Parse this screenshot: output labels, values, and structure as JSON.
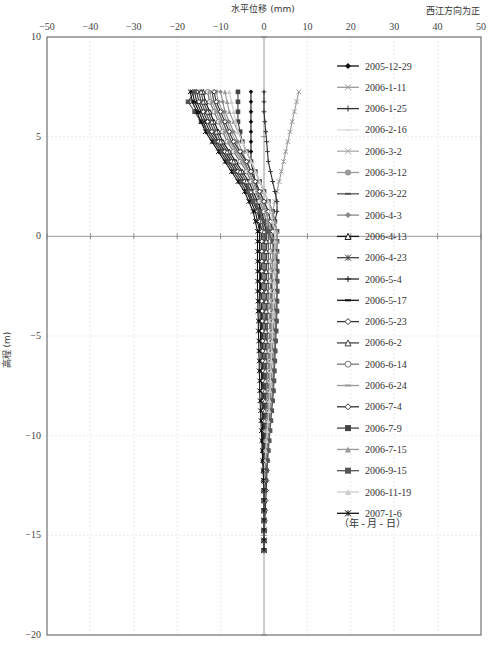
{
  "chart_data": {
    "type": "line",
    "title": "水平位移 (mm)",
    "direction_note": "西江方向为正",
    "xlabel": "水平位移 (mm)",
    "ylabel": "高程 (m)",
    "xlim": [
      -50,
      50
    ],
    "ylim": [
      -20,
      10
    ],
    "x_ticks": [
      -50,
      -40,
      -30,
      -20,
      -10,
      0,
      10,
      20,
      30,
      40,
      50
    ],
    "y_ticks": [
      10,
      5,
      0,
      -5,
      -10,
      -15,
      -20
    ],
    "grid": true,
    "legend_position": "right-inside",
    "legend_footer": "（年 - 月 - 日）",
    "depth": [
      7.25,
      6.75,
      6.25,
      5.75,
      5.25,
      4.75,
      4.25,
      3.75,
      3.25,
      2.75,
      2.25,
      1.75,
      1.25,
      0.75,
      0.25,
      -0.25,
      -0.75,
      -1.25,
      -1.75,
      -2.25,
      -2.75,
      -3.25,
      -3.75,
      -4.25,
      -4.75,
      -5.25,
      -5.75,
      -6.25,
      -6.75,
      -7.25,
      -7.75,
      -8.25,
      -8.75,
      -9.25,
      -9.75,
      -10.25,
      -10.75,
      -11.25,
      -11.75,
      -12.25,
      -12.75,
      -13.25,
      -13.75,
      -14.25,
      -14.75,
      -15.25,
      -15.75
    ],
    "series": [
      {
        "name": "2005-12-29",
        "color": "#111111",
        "marker": "diamond",
        "values": [
          -3,
          -3,
          -3,
          -3,
          -3,
          -3,
          -3,
          -3,
          -2.5,
          -2,
          -1.5,
          -1,
          -1,
          -1,
          -1,
          -1,
          -1,
          -1,
          -0.8,
          -0.8,
          -0.8,
          -0.6,
          -0.6,
          -0.6,
          -0.5,
          -0.5,
          -0.4,
          -0.4,
          -0.3,
          -0.3,
          -0.2,
          -0.2,
          -0.2,
          -0.1,
          -0.1,
          0,
          0,
          0,
          0,
          0,
          0,
          0,
          0,
          0,
          0,
          0,
          0
        ]
      },
      {
        "name": "2006-1-11",
        "color": "#999999",
        "marker": "x",
        "values": [
          8,
          7.5,
          7,
          6.5,
          6,
          5.5,
          5,
          4.5,
          4,
          3.5,
          3,
          2.5,
          2,
          2,
          2,
          2,
          2,
          2,
          2,
          1.8,
          1.8,
          1.6,
          1.6,
          1.5,
          1.4,
          1.3,
          1.2,
          1.1,
          1,
          1,
          0.9,
          0.8,
          0.7,
          0.6,
          0.5,
          0.4,
          0.3,
          0.3,
          0.2,
          0.2,
          0.1,
          0.1,
          0,
          0,
          0,
          0,
          0
        ]
      },
      {
        "name": "2006-1-25",
        "color": "#333333",
        "marker": "plus",
        "values": [
          0,
          0,
          0,
          0.2,
          0.4,
          0.6,
          0.8,
          1,
          1.5,
          2,
          2.5,
          3,
          3,
          2.5,
          2,
          2,
          2,
          2,
          1.8,
          1.8,
          1.7,
          1.6,
          1.5,
          1.4,
          1.3,
          1.2,
          1.1,
          1,
          1,
          0.9,
          0.8,
          0.7,
          0.6,
          0.5,
          0.4,
          0.3,
          0.3,
          0.2,
          0.2,
          0.1,
          0.1,
          0,
          0,
          0,
          0,
          0,
          0
        ]
      },
      {
        "name": "2006-2-16",
        "color": "#dddddd",
        "marker": "dash",
        "values": [
          -13,
          -12.5,
          -11.5,
          -10.5,
          -9.5,
          -8.5,
          -7,
          -5.5,
          -4,
          -3,
          -2,
          -1,
          0,
          0.5,
          0.5,
          0.5,
          0.5,
          0.5,
          0.5,
          0.5,
          0.5,
          0.5,
          0.5,
          0.4,
          0.4,
          0.4,
          0.3,
          0.3,
          0.3,
          0.2,
          0.2,
          0.2,
          0.2,
          0.1,
          0.1,
          0.1,
          0,
          0,
          0,
          0,
          0,
          0,
          0,
          0,
          0,
          0,
          0
        ]
      },
      {
        "name": "2006-3-2",
        "color": "#aaaaaa",
        "marker": "x",
        "values": [
          -12,
          -11.5,
          -10.5,
          -9.5,
          -8.5,
          -7.5,
          -6.5,
          -5,
          -3.5,
          -2.5,
          -1.5,
          -0.5,
          0.5,
          1,
          1,
          1,
          1,
          1,
          1,
          1,
          0.9,
          0.9,
          0.8,
          0.8,
          0.7,
          0.7,
          0.6,
          0.6,
          0.5,
          0.5,
          0.4,
          0.4,
          0.3,
          0.3,
          0.2,
          0.2,
          0.1,
          0.1,
          0,
          0,
          0,
          0,
          0,
          0,
          0,
          0,
          0
        ]
      },
      {
        "name": "2006-3-12",
        "color": "#999999",
        "marker": "circle",
        "values": [
          -11,
          -10.5,
          -9.5,
          -8.5,
          -7.5,
          -6.5,
          -5.5,
          -4,
          -3,
          -2,
          -1,
          0,
          1,
          1.5,
          1.5,
          1.5,
          1.5,
          1.5,
          1.5,
          1.5,
          1.4,
          1.4,
          1.3,
          1.3,
          1.2,
          1.2,
          1.1,
          1.1,
          1,
          1,
          0.9,
          0.8,
          0.8,
          0.7,
          0.6,
          0.5,
          0.4,
          0.3,
          0.2,
          0.1,
          0,
          0,
          0,
          0,
          0,
          0,
          0
        ]
      },
      {
        "name": "2006-3-22",
        "color": "#555555",
        "marker": "dash",
        "values": [
          -12,
          -11.5,
          -10.5,
          -9.5,
          -8.5,
          -7.5,
          -6,
          -4.5,
          -3.5,
          -2.5,
          -1.5,
          -0.5,
          0.5,
          1,
          1,
          1,
          1,
          1,
          1,
          1,
          1,
          0.9,
          0.9,
          0.8,
          0.8,
          0.7,
          0.7,
          0.6,
          0.6,
          0.5,
          0.5,
          0.4,
          0.4,
          0.3,
          0.3,
          0.2,
          0.2,
          0.1,
          0.1,
          0,
          0,
          0,
          0,
          0,
          0,
          0,
          0
        ]
      },
      {
        "name": "2006-4-3",
        "color": "#888888",
        "marker": "diamond",
        "values": [
          -10,
          -9.5,
          -9,
          -8,
          -7,
          -6,
          -5,
          -4,
          -3,
          -2,
          -1,
          0,
          1,
          1.5,
          2,
          2,
          2,
          2,
          2,
          1.9,
          1.9,
          1.8,
          1.8,
          1.7,
          1.6,
          1.5,
          1.4,
          1.3,
          1.2,
          1.1,
          1,
          0.9,
          0.8,
          0.7,
          0.6,
          0.5,
          0.4,
          0.3,
          0.2,
          0.1,
          0,
          0,
          0,
          0,
          0,
          0,
          0
        ]
      },
      {
        "name": "2006-4-13",
        "color": "#111111",
        "marker": "triangle-open",
        "values": [
          -14,
          -13.5,
          -12.5,
          -11.5,
          -10.5,
          -9.5,
          -8,
          -6.5,
          -5,
          -3.5,
          -2.5,
          -1.5,
          -0.5,
          0,
          0.5,
          0.5,
          0.5,
          0.5,
          0.5,
          0.5,
          0.5,
          0.5,
          0.5,
          0.4,
          0.4,
          0.4,
          0.3,
          0.3,
          0.3,
          0.2,
          0.2,
          0.2,
          0.1,
          0.1,
          0,
          0,
          0,
          0,
          0,
          0,
          0,
          0,
          0,
          0,
          0,
          0,
          0
        ]
      },
      {
        "name": "2006-4-23",
        "color": "#444444",
        "marker": "asterisk",
        "values": [
          -15,
          -14.5,
          -13.5,
          -12.5,
          -11.5,
          -10.5,
          -9,
          -7.5,
          -6,
          -4.5,
          -3,
          -2,
          -1,
          -0.5,
          0,
          0,
          0,
          0,
          0,
          0,
          0,
          0,
          0,
          0,
          0,
          0,
          0,
          0,
          0,
          0,
          0,
          0,
          0,
          0,
          0,
          0,
          0,
          0,
          0,
          0,
          0,
          0,
          0,
          0,
          0,
          0,
          0
        ]
      },
      {
        "name": "2006-5-4",
        "color": "#222222",
        "marker": "plus",
        "values": [
          -16,
          -15.5,
          -14.5,
          -13.5,
          -12.5,
          -11,
          -9.5,
          -8,
          -6.5,
          -5,
          -3.5,
          -2.5,
          -1.5,
          -1,
          -0.5,
          -0.5,
          -0.5,
          -0.5,
          -0.5,
          -0.5,
          -0.5,
          -0.5,
          -0.5,
          -0.5,
          -0.4,
          -0.4,
          -0.4,
          -0.3,
          -0.3,
          -0.3,
          -0.2,
          -0.2,
          -0.2,
          -0.1,
          -0.1,
          -0.1,
          0,
          0,
          0,
          0,
          0,
          0,
          0,
          0,
          0,
          0,
          0
        ]
      },
      {
        "name": "2006-5-17",
        "color": "#111111",
        "marker": "dash",
        "values": [
          -16.5,
          -16,
          -15,
          -14,
          -13,
          -11.5,
          -10,
          -8.5,
          -7,
          -5.5,
          -4,
          -3,
          -2,
          -1.5,
          -1,
          -1,
          -1,
          -1,
          -1,
          -1,
          -1,
          -1,
          -0.9,
          -0.9,
          -0.8,
          -0.8,
          -0.7,
          -0.7,
          -0.6,
          -0.6,
          -0.5,
          -0.5,
          -0.4,
          -0.4,
          -0.3,
          -0.3,
          -0.2,
          -0.2,
          -0.1,
          -0.1,
          0,
          0,
          0,
          0,
          0,
          0,
          0
        ]
      },
      {
        "name": "2006-5-23",
        "color": "#333333",
        "marker": "diamond-open",
        "values": [
          -15.5,
          -15,
          -14,
          -13,
          -12,
          -10.5,
          -9,
          -7.5,
          -6,
          -4.5,
          -3.5,
          -2.5,
          -1.5,
          -1,
          -0.5,
          -0.5,
          -0.5,
          -0.5,
          -0.5,
          -0.5,
          -0.5,
          -0.5,
          -0.4,
          -0.4,
          -0.4,
          -0.3,
          -0.3,
          -0.3,
          -0.2,
          -0.2,
          -0.2,
          -0.1,
          -0.1,
          -0.1,
          0,
          0,
          0,
          0,
          0,
          0,
          0,
          0,
          0,
          0,
          0,
          0,
          0
        ]
      },
      {
        "name": "2006-6-2",
        "color": "#444444",
        "marker": "triangle-open",
        "values": [
          -14.5,
          -14,
          -13,
          -12,
          -11,
          -10,
          -8.5,
          -7,
          -5.5,
          -4,
          -3,
          -2,
          -1,
          -0.5,
          0,
          0.5,
          0.5,
          0.5,
          0.5,
          0.5,
          0.5,
          0.5,
          0.5,
          0.5,
          0.4,
          0.4,
          0.4,
          0.3,
          0.3,
          0.3,
          0.2,
          0.2,
          0.2,
          0.1,
          0.1,
          0.1,
          0,
          0,
          0,
          0,
          0,
          0,
          0,
          0,
          0,
          0,
          0
        ]
      },
      {
        "name": "2006-6-14",
        "color": "#777777",
        "marker": "circle-open",
        "values": [
          -13,
          -12.5,
          -11.5,
          -10.5,
          -9.5,
          -8.5,
          -7,
          -5.5,
          -4,
          -3,
          -2,
          -1,
          0,
          0.5,
          1,
          1.5,
          1.5,
          1.5,
          1.5,
          1.5,
          1.5,
          1.5,
          1.4,
          1.4,
          1.3,
          1.3,
          1.2,
          1.2,
          1.1,
          1.1,
          1,
          1,
          0.9,
          0.8,
          0.7,
          0.6,
          0.5,
          0.4,
          0.3,
          0.2,
          0.1,
          0,
          0,
          0,
          0,
          0,
          0
        ]
      },
      {
        "name": "2006-6-24",
        "color": "#999999",
        "marker": "dash",
        "values": [
          -12.5,
          -12,
          -11,
          -10,
          -9,
          -8,
          -6.5,
          -5,
          -3.5,
          -2.5,
          -1.5,
          -0.5,
          0.5,
          1,
          1.5,
          2,
          2,
          2,
          2,
          2,
          2,
          1.9,
          1.9,
          1.8,
          1.8,
          1.7,
          1.6,
          1.5,
          1.4,
          1.3,
          1.2,
          1.1,
          1,
          0.9,
          0.8,
          0.7,
          0.6,
          0.5,
          0.4,
          0.3,
          0.2,
          0.1,
          0,
          0,
          0,
          0,
          0
        ]
      },
      {
        "name": "2006-7-4",
        "color": "#333333",
        "marker": "diamond-open",
        "values": [
          -11.5,
          -11,
          -10,
          -9,
          -8,
          -7,
          -5.5,
          -4,
          -3,
          -2,
          -1,
          0,
          1,
          1.5,
          2,
          2.5,
          2.5,
          2.5,
          2.5,
          2.5,
          2.4,
          2.4,
          2.3,
          2.2,
          2.1,
          2,
          1.9,
          1.8,
          1.7,
          1.6,
          1.5,
          1.4,
          1.3,
          1.2,
          1.1,
          1,
          0.9,
          0.8,
          0.7,
          0.6,
          0.5,
          0.4,
          0.3,
          0.2,
          0.1,
          0,
          0
        ]
      },
      {
        "name": "2006-7-9",
        "color": "#444444",
        "marker": "square",
        "values": [
          -6,
          -6,
          -6,
          -6,
          -5.5,
          -5,
          -4,
          -3,
          -2,
          -1,
          0,
          1,
          2,
          2.5,
          3,
          3,
          3,
          3,
          3,
          3,
          3,
          2.9,
          2.8,
          2.7,
          2.6,
          2.5,
          2.4,
          2.3,
          2.2,
          2.1,
          2,
          1.8,
          1.6,
          1.4,
          1.2,
          1,
          0.8,
          0.6,
          0.4,
          0.2,
          0,
          0,
          0,
          0,
          0,
          0,
          0
        ]
      },
      {
        "name": "2006-7-15",
        "color": "#999999",
        "marker": "triangle",
        "values": [
          -9,
          -8.5,
          -8,
          -7,
          -6,
          -5,
          -4,
          -3,
          -2,
          -1,
          0,
          1,
          2,
          2.5,
          3,
          3,
          3,
          3,
          3,
          2.9,
          2.9,
          2.8,
          2.7,
          2.6,
          2.5,
          2.4,
          2.3,
          2.2,
          2.1,
          2,
          1.9,
          1.8,
          1.6,
          1.4,
          1.2,
          1,
          0.8,
          0.6,
          0.4,
          0.2,
          0,
          0,
          0,
          0,
          0,
          0,
          0
        ]
      },
      {
        "name": "2006-9-15",
        "color": "#555555",
        "marker": "square",
        "values": [
          -16,
          -17.5,
          -16,
          -14.5,
          -13,
          -11.5,
          -10,
          -8.5,
          -7,
          -5.5,
          -4,
          -2.5,
          -1,
          0,
          1,
          2,
          2.5,
          3,
          3,
          3,
          3,
          3,
          3,
          2.9,
          2.8,
          2.7,
          2.6,
          2.5,
          2.4,
          2.3,
          2.2,
          2,
          1.8,
          1.6,
          1.4,
          1.2,
          1,
          0.8,
          0.6,
          0.4,
          0.2,
          0,
          0,
          0,
          0,
          0,
          0
        ]
      },
      {
        "name": "2006-11-19",
        "color": "#cccccc",
        "marker": "triangle",
        "values": [
          -8,
          -7.5,
          -7,
          -6.5,
          -6,
          -5,
          -4,
          -3,
          -2,
          -1,
          0,
          1,
          1.5,
          2,
          2.5,
          2.5,
          2.5,
          2.5,
          2.5,
          2.4,
          2.4,
          2.3,
          2.2,
          2.1,
          2,
          1.9,
          1.8,
          1.7,
          1.6,
          1.5,
          1.4,
          1.3,
          1.2,
          1,
          0.8,
          0.6,
          0.4,
          0.2,
          0,
          0,
          0,
          0,
          0,
          0,
          0,
          0,
          0
        ]
      },
      {
        "name": "2007-1-6",
        "color": "#111111",
        "marker": "asterisk",
        "values": [
          -17,
          -16.5,
          -15.5,
          -14.5,
          -13.5,
          -12,
          -10.5,
          -9,
          -7.5,
          -6,
          -4.5,
          -3.5,
          -2.5,
          -2,
          -1.5,
          -1.5,
          -1.5,
          -1.5,
          -1.5,
          -1.5,
          -1.5,
          -1.4,
          -1.4,
          -1.3,
          -1.3,
          -1.2,
          -1.2,
          -1.1,
          -1.1,
          -1,
          -1,
          -0.9,
          -0.8,
          -0.7,
          -0.6,
          -0.5,
          -0.4,
          -0.3,
          -0.2,
          -0.1,
          0,
          0,
          0,
          0,
          0,
          0,
          0
        ]
      }
    ]
  }
}
